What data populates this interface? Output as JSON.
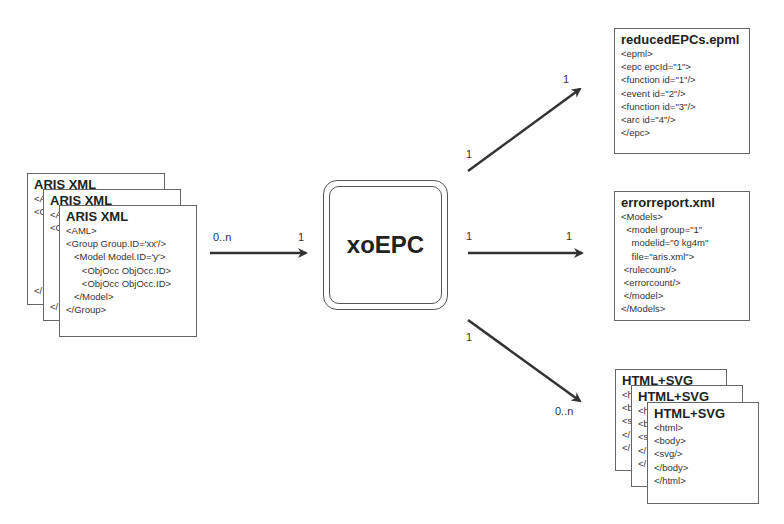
{
  "input": {
    "stack_count": 3,
    "doc": {
      "title": "ARIS XML",
      "lines": [
        "<AML>",
        "<Group Group.ID='xx'/>",
        "   <Model Model.ID='y'>",
        "      <ObjOcc ObjOcc.ID>",
        "      <ObjOcc ObjOcc.ID>",
        "   </Model>",
        "</Group>"
      ],
      "back_fragments": [
        "<A",
        "<C",
        "</"
      ]
    },
    "arrow": {
      "source_multiplicity": "0..n",
      "target_multiplicity": "1"
    }
  },
  "processor": {
    "label": "xoEPC"
  },
  "outputs": [
    {
      "title": "reducedEPCs.epml",
      "lines": [
        "<epml>",
        "<epc epcId=\"1\">",
        "<function id=\"1\"/>",
        "<event id=\"2\"/>",
        "<function id=\"3\"/>",
        "<arc id=\"4\"/>",
        "</epc>"
      ],
      "arrow": {
        "source_multiplicity": "1",
        "target_multiplicity": "1"
      }
    },
    {
      "title": "errorreport.xml",
      "lines": [
        "<Models>",
        "  <model group=\"1\"",
        "    modelid=\"0 kg4m\"",
        "    file=\"aris.xml\">",
        " <rulecount/>",
        " <errorcount/>",
        " </model>",
        "</Models>"
      ],
      "arrow": {
        "source_multiplicity": "1",
        "target_multiplicity": "1"
      }
    },
    {
      "title": "HTML+SVG",
      "stack_count": 3,
      "lines": [
        "<html>",
        "<body>",
        "<svg/>",
        "</body>",
        "</html>"
      ],
      "back_fragments": [
        "<h",
        "<b",
        "<s",
        "</",
        "</"
      ],
      "arrow": {
        "source_multiplicity": "1",
        "target_multiplicity": "0..n"
      }
    }
  ],
  "colors": {
    "stroke": "#333333",
    "border": "#666666",
    "background": "#ffffff"
  }
}
